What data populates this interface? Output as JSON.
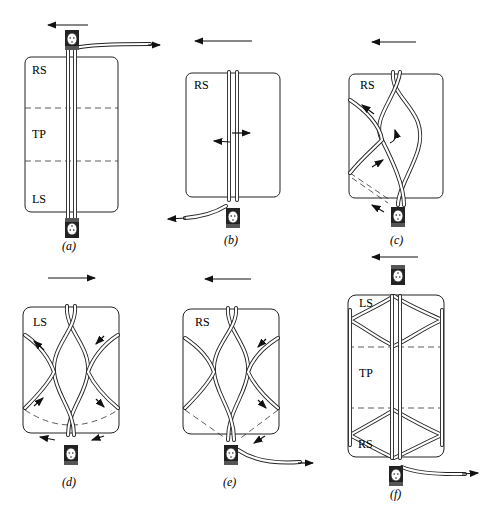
{
  "figure": {
    "panels": [
      {
        "id": "a",
        "caption": "(a)",
        "labels": [
          "RS",
          "TP",
          "LS"
        ],
        "direction": "left"
      },
      {
        "id": "b",
        "caption": "(b)",
        "labels": [
          "RS"
        ],
        "direction": "left"
      },
      {
        "id": "c",
        "caption": "(c)",
        "labels": [
          "RS"
        ],
        "direction": "left"
      },
      {
        "id": "d",
        "caption": "(d)",
        "labels": [
          "LS"
        ],
        "direction": "right"
      },
      {
        "id": "e",
        "caption": "(e)",
        "labels": [
          "RS"
        ],
        "direction": "left"
      },
      {
        "id": "f",
        "caption": "(f)",
        "labels": [
          "LS",
          "TP",
          "RS"
        ],
        "direction": "left"
      }
    ]
  },
  "icons": {
    "clip": "rope-clip-icon",
    "arrow": "direction-arrow-icon"
  },
  "colors": {
    "ink": "#222222",
    "paper": "#ffffff"
  }
}
